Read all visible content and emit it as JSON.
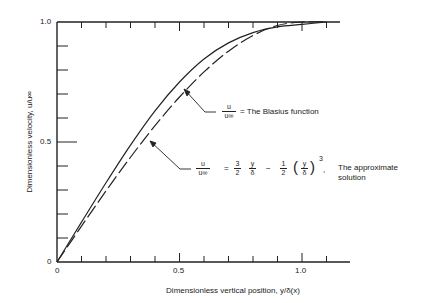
{
  "chart_data": {
    "type": "line",
    "title": "",
    "xlabel": "Dimensionless vertical position, y/δ(x)",
    "ylabel": "Dimensionless velocity, u/u∞",
    "xlim": [
      0,
      1.2
    ],
    "ylim": [
      0,
      1.0
    ],
    "x_ticks": [
      0,
      0.1,
      0.2,
      0.3,
      0.4,
      0.5,
      0.6,
      0.7,
      0.8,
      0.9,
      1.0,
      1.1
    ],
    "x_tick_labels": [
      "0",
      "0.5",
      "1.0"
    ],
    "y_ticks": [
      0,
      0.1,
      0.2,
      0.3,
      0.4,
      0.5,
      0.6,
      0.7,
      0.8,
      0.9,
      1.0
    ],
    "y_tick_labels": [
      "0",
      "0.5",
      "1.0"
    ],
    "grid": false,
    "legend": "none",
    "series": [
      {
        "name": "The Blasius function",
        "style": "solid",
        "x": [
          0,
          0.1,
          0.2,
          0.3,
          0.4,
          0.5,
          0.6,
          0.7,
          0.8,
          0.9,
          1.0,
          1.1
        ],
        "y": [
          0,
          0.166,
          0.33,
          0.487,
          0.63,
          0.75,
          0.846,
          0.913,
          0.956,
          0.98,
          0.99,
          1.0
        ]
      },
      {
        "name": "The approximate solution",
        "style": "dashed",
        "x": [
          0,
          0.1,
          0.2,
          0.3,
          0.4,
          0.5,
          0.6,
          0.7,
          0.8,
          0.9,
          1.0,
          1.1
        ],
        "y": [
          0,
          0.1495,
          0.296,
          0.4365,
          0.568,
          0.6875,
          0.792,
          0.8785,
          0.944,
          0.9855,
          1.0,
          1.0
        ]
      }
    ],
    "annotations": [
      {
        "text": "u/u∞ = The Blasius function",
        "points_to": "solid curve"
      },
      {
        "text": "u/u∞ = 3/2 y/δ − 1/2 (y/δ)^3, The approximate solution",
        "points_to": "dashed curve"
      }
    ]
  },
  "labels": {
    "x_axis": "Dimensionless vertical position, y/δ(x)",
    "y_axis": "Dimensionless velocity, u/u∞",
    "x_tick_0": "0",
    "x_tick_05": "0.5",
    "x_tick_10": "1.0",
    "y_tick_0": "0",
    "y_tick_05": "0.5",
    "y_tick_10": "1.0"
  },
  "callouts": {
    "blasius": {
      "num": "u",
      "den": "u∞",
      "eq": "= The Blasius function"
    },
    "approx": {
      "num": "u",
      "den": "u∞",
      "eq1": "=",
      "f1n": "3",
      "f1d": "2",
      "f2n": "y",
      "f2d": "δ",
      "minus": "−",
      "f3n": "1",
      "f3d": "2",
      "f4n": "y",
      "f4d": "δ",
      "lp": "(",
      "rp": ")",
      "exp": "3",
      "comma": ",",
      "text1": "The approximate",
      "text2": "solution"
    }
  }
}
